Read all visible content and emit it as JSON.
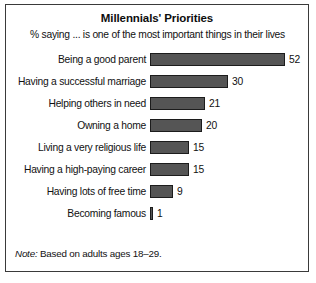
{
  "figure": {
    "title": "Millennials' Priorities",
    "subtitle": "% saying ... is one of the most important things in their lives",
    "note_word": "Note:",
    "note_text": " Based on adults ages 18–29."
  },
  "colors": {
    "bar_fill": "#555555",
    "bar_outline": "#1c1c1c",
    "frame": "#3a3a3a",
    "text": "#111111",
    "background": "#ffffff"
  },
  "chart_data": {
    "type": "bar",
    "orientation": "horizontal",
    "title": "Millennials' Priorities",
    "subtitle": "% saying ... is one of the most important things in their lives",
    "xlabel": "",
    "ylabel": "",
    "xlim": [
      0,
      52
    ],
    "grid": false,
    "legend": "none",
    "data_labels": true,
    "units": "percent",
    "note": "Note: Based on adults ages 18–29.",
    "categories": [
      "Being a good parent",
      "Having a successful marriage",
      "Helping others in need",
      "Owning a home",
      "Living a very religious life",
      "Having a high-paying career",
      "Having lots of free time",
      "Becoming famous"
    ],
    "values": [
      52,
      30,
      21,
      20,
      15,
      15,
      9,
      1
    ],
    "value_labels": [
      "52",
      "30",
      "21",
      "20",
      "15",
      "15",
      "9",
      "1"
    ]
  }
}
